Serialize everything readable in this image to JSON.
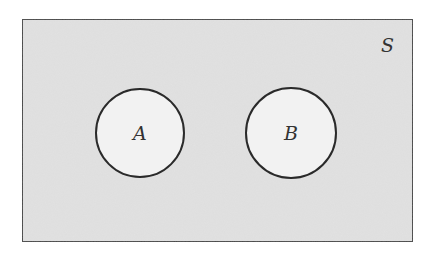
{
  "diagram": {
    "type": "venn",
    "universe": {
      "label": "S",
      "x": 22,
      "y": 19,
      "width": 391,
      "height": 223,
      "fill": "#e2e2e2",
      "stroke": "#444444"
    },
    "sets": [
      {
        "label": "A",
        "cx": 140,
        "cy": 133,
        "r": 44,
        "fill": "#f2f2f2",
        "stroke": "#2a2a2a"
      },
      {
        "label": "B",
        "cx": 291,
        "cy": 133,
        "r": 45,
        "fill": "#f2f2f2",
        "stroke": "#2a2a2a"
      }
    ]
  }
}
